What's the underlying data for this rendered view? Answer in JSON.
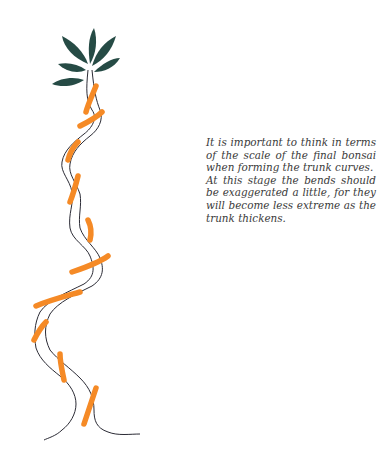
{
  "caption": {
    "paragraph_1": "It is important to think in terms of the scale of the final bonsai when forming the trunk curves.",
    "paragraph_2": "At this stage the bends should be exaggerated a little, for they will become less extreme as the trunk thickens."
  },
  "illustration": {
    "subject": "bonsai trunk wired with orange wire",
    "colors": {
      "leaves": "#264b45",
      "wire": "#f58a26",
      "trunk_outline": "#2b2b35"
    }
  }
}
